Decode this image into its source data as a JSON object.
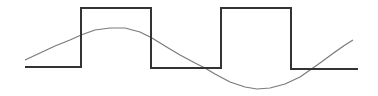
{
  "diagram": {
    "type": "waveform",
    "colors": {
      "background": "#ffffff",
      "square_wave": "#333333",
      "sine_wave": "#7a7a7a"
    },
    "square_wave": {
      "points": "25,67 81,67 81,8 151,8 151,68 221,68 221,8 291,8 291,69 358,69"
    },
    "sine_wave": {
      "points": "25,60 40,53 55,46 70,40 81,35 95,30 110,28 125,28 140,32 152,38 165,46 180,55 195,63 205,68 215,74 230,82 245,87 257,89 270,88 285,84 300,77 310,70 320,63 335,52 345,45 353,40"
    }
  }
}
